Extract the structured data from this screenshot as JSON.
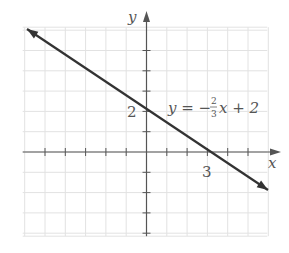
{
  "chart_data": {
    "type": "line",
    "title": "",
    "xlabel": "x",
    "ylabel": "y",
    "xlim": [
      -6,
      6
    ],
    "ylim": [
      -4,
      6
    ],
    "grid": true,
    "series": [
      {
        "name": "y = -2/3 x + 2",
        "slope": -0.6667,
        "intercept": 2,
        "x": [
          -6,
          6
        ],
        "y": [
          6,
          -2
        ],
        "arrows": "both"
      }
    ],
    "annotations": [
      {
        "text": "2",
        "at": [
          0,
          2
        ],
        "role": "y-intercept label"
      },
      {
        "text": "3",
        "at": [
          3,
          0
        ],
        "role": "x-intercept label"
      }
    ],
    "equation_label": {
      "prefix": "y = −",
      "numerator": "2",
      "denominator": "3",
      "suffix": "x + 2"
    }
  },
  "colors": {
    "grid": "#e2e2e2",
    "axis": "#555555",
    "line": "#333333",
    "text": "#555555"
  }
}
